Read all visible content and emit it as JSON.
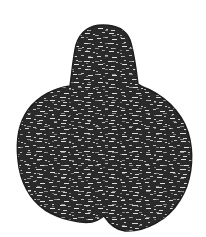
{
  "image": {
    "subject": "dark textured gourd/pear-shaped silhouette",
    "background_color": "#ffffff",
    "fill_color": "#2a2a2a",
    "speckle_color": "#d8d8d8"
  }
}
